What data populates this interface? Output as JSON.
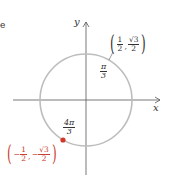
{
  "diagram": {
    "type": "unit-circle",
    "axes": {
      "x_label": "x",
      "y_label": "y"
    },
    "colors": {
      "circle": "#bdbdbd",
      "axis": "#555555",
      "point": "#d2382a",
      "point_label": "#c8412e",
      "text": "#333333"
    },
    "points": [
      {
        "angle_label": {
          "num": "π",
          "den": "3"
        },
        "coords": {
          "x": {
            "sign": "",
            "num": "1",
            "den": "2"
          },
          "y": {
            "sign": "",
            "num": "√3",
            "den": "2"
          }
        },
        "marked": false
      },
      {
        "angle_label": {
          "num": "4π",
          "den": "3"
        },
        "coords": {
          "x": {
            "sign": "−",
            "num": "1",
            "den": "2"
          },
          "y": {
            "sign": "−",
            "num": "√3",
            "den": "2"
          }
        },
        "marked": true
      }
    ],
    "stray_mark": "e"
  }
}
